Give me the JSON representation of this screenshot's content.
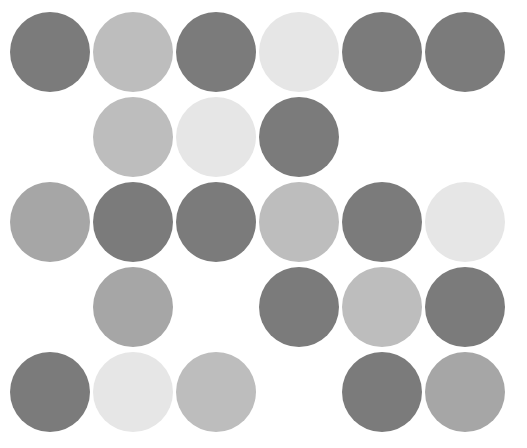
{
  "layout": {
    "col_x": [
      10,
      93,
      176,
      259,
      342,
      425
    ],
    "row_y": [
      12,
      97,
      182,
      267,
      352
    ],
    "diameter": 80
  },
  "palette": {
    "dark": "#7b7b7b",
    "medium": "#a6a6a6",
    "light": "#bdbdbd",
    "pale": "#e6e6e6"
  },
  "grid": [
    [
      "dark",
      "light",
      "dark",
      "pale",
      "dark",
      "dark"
    ],
    [
      null,
      "light",
      "pale",
      "dark",
      null,
      null
    ],
    [
      "medium",
      "dark",
      "dark",
      "light",
      "dark",
      "pale"
    ],
    [
      null,
      "medium",
      null,
      "dark",
      "light",
      "dark"
    ],
    [
      "dark",
      "pale",
      "light",
      null,
      "dark",
      "medium"
    ]
  ]
}
